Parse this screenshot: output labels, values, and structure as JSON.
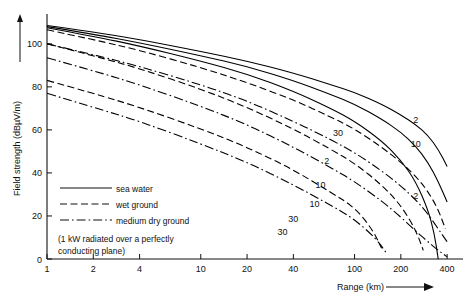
{
  "chart_data": {
    "type": "line",
    "title": "",
    "xlabel": "Range (km)",
    "ylabel": "Field strength (dBµV/m)",
    "xscale": "log",
    "yscale": "linear",
    "xlim": [
      1,
      450
    ],
    "ylim": [
      0,
      112
    ],
    "grid": false,
    "xticks": [
      1,
      2,
      4,
      10,
      20,
      40,
      100,
      200,
      400
    ],
    "xticklabels": [
      "1",
      "2",
      "4",
      "10",
      "20",
      "40",
      "100",
      "200",
      "400"
    ],
    "yticks": [
      0,
      20,
      40,
      60,
      80,
      100
    ],
    "yticklabels": [
      "0",
      "20",
      "40",
      "60",
      "80",
      "100"
    ],
    "legend_position": "inside-lower-left",
    "annotation": "(1 kW radiated over a perfectly conducting plane)",
    "legend": [
      {
        "label": "sea water",
        "style": "solid"
      },
      {
        "label": "wet ground",
        "style": "dashed"
      },
      {
        "label": "medium dry ground",
        "style": "dashdot"
      }
    ],
    "series": [
      {
        "name": "sea water 2 MHz",
        "group": "sea water",
        "frequency_mhz": 2,
        "label": "2",
        "style": "solid",
        "label_at": {
          "x": 250,
          "y": 63
        },
        "x": [
          1,
          2,
          4,
          10,
          20,
          40,
          70,
          100,
          150,
          200,
          250,
          300,
          350,
          400
        ],
        "y": [
          108.5,
          105.5,
          102.0,
          96.5,
          92.0,
          86.5,
          81.0,
          77.5,
          72.0,
          67.0,
          62.5,
          57.5,
          51.0,
          43.0
        ]
      },
      {
        "name": "sea water 10 MHz",
        "group": "sea water",
        "frequency_mhz": 10,
        "label": "10",
        "style": "solid",
        "label_at": {
          "x": 250,
          "y": 52
        },
        "x": [
          1,
          2,
          4,
          10,
          20,
          40,
          70,
          100,
          150,
          200,
          250,
          300,
          350,
          400
        ],
        "y": [
          108.0,
          104.5,
          100.5,
          94.5,
          89.5,
          83.0,
          76.5,
          72.0,
          65.0,
          59.0,
          52.5,
          45.0,
          36.0,
          26.5
        ]
      },
      {
        "name": "sea water 30 MHz",
        "group": "sea water",
        "frequency_mhz": 30,
        "label": "30",
        "style": "solid",
        "label_at": {
          "x": 78,
          "y": 57
        },
        "x": [
          1,
          2,
          4,
          10,
          20,
          40,
          70,
          100,
          150,
          200,
          250,
          300,
          330,
          350
        ],
        "y": [
          107.5,
          103.5,
          99.0,
          92.0,
          86.0,
          78.0,
          70.0,
          64.0,
          55.0,
          46.0,
          36.0,
          23.0,
          12.0,
          0.0
        ]
      },
      {
        "name": "wet ground 2 MHz",
        "group": "wet ground",
        "frequency_mhz": 2,
        "label": "2",
        "style": "dashed",
        "label_at": {
          "x": 250,
          "y": 28
        },
        "x": [
          1,
          2,
          4,
          10,
          20,
          40,
          70,
          100,
          150,
          200,
          250,
          300,
          350,
          390
        ],
        "y": [
          106.5,
          102.0,
          97.0,
          89.0,
          82.0,
          74.0,
          66.0,
          60.5,
          52.0,
          45.0,
          38.5,
          31.5,
          23.0,
          14.0
        ]
      },
      {
        "name": "wet ground 10 MHz",
        "group": "wet ground",
        "frequency_mhz": 10,
        "label": "10",
        "style": "dashed",
        "label_at": {
          "x": 60,
          "y": 33
        },
        "x": [
          1,
          2,
          4,
          10,
          20,
          40,
          70,
          100,
          150,
          200,
          250,
          280
        ],
        "y": [
          100.0,
          94.5,
          88.5,
          79.0,
          70.5,
          60.5,
          51.0,
          44.5,
          34.5,
          25.0,
          13.5,
          4.0
        ]
      },
      {
        "name": "wet ground 30 MHz",
        "group": "wet ground",
        "frequency_mhz": 30,
        "label": "30",
        "style": "dashed",
        "label_at": {
          "x": 40,
          "y": 17
        },
        "x": [
          1,
          2,
          4,
          10,
          20,
          40,
          70,
          100,
          130,
          150
        ],
        "y": [
          83.0,
          77.0,
          70.5,
          60.5,
          52.0,
          41.5,
          31.0,
          24.0,
          14.0,
          5.0
        ]
      },
      {
        "name": "medium dry ground 2 MHz",
        "group": "medium dry ground",
        "frequency_mhz": 2,
        "label": "2",
        "style": "dashdot",
        "label_at": {
          "x": 66,
          "y": 44
        },
        "x": [
          1,
          2,
          4,
          10,
          20,
          40,
          70,
          100,
          150,
          200,
          250,
          300,
          350,
          400
        ],
        "y": [
          100.0,
          95.0,
          89.5,
          81.0,
          73.5,
          64.0,
          55.5,
          49.5,
          41.0,
          34.0,
          27.5,
          21.0,
          14.0,
          8.0
        ]
      },
      {
        "name": "medium dry ground 10 MHz",
        "group": "medium dry ground",
        "frequency_mhz": 10,
        "label": "10",
        "style": "dashdot",
        "label_at": {
          "x": 55,
          "y": 24
        },
        "x": [
          1,
          2,
          4,
          10,
          20,
          40,
          70,
          100,
          150,
          200,
          250,
          300,
          350,
          400
        ],
        "y": [
          93.5,
          87.5,
          81.0,
          71.0,
          62.5,
          52.0,
          42.5,
          36.0,
          27.0,
          19.5,
          13.0,
          8.0,
          4.0,
          1.0
        ]
      },
      {
        "name": "medium dry ground 30 MHz",
        "group": "medium dry ground",
        "frequency_mhz": 30,
        "label": "30",
        "style": "dashdot",
        "label_at": {
          "x": 34,
          "y": 11
        },
        "x": [
          1,
          2,
          4,
          10,
          20,
          40,
          70,
          100,
          140,
          160
        ],
        "y": [
          77.0,
          70.5,
          64.0,
          53.5,
          45.0,
          34.5,
          25.0,
          18.5,
          9.0,
          3.0
        ]
      }
    ]
  }
}
